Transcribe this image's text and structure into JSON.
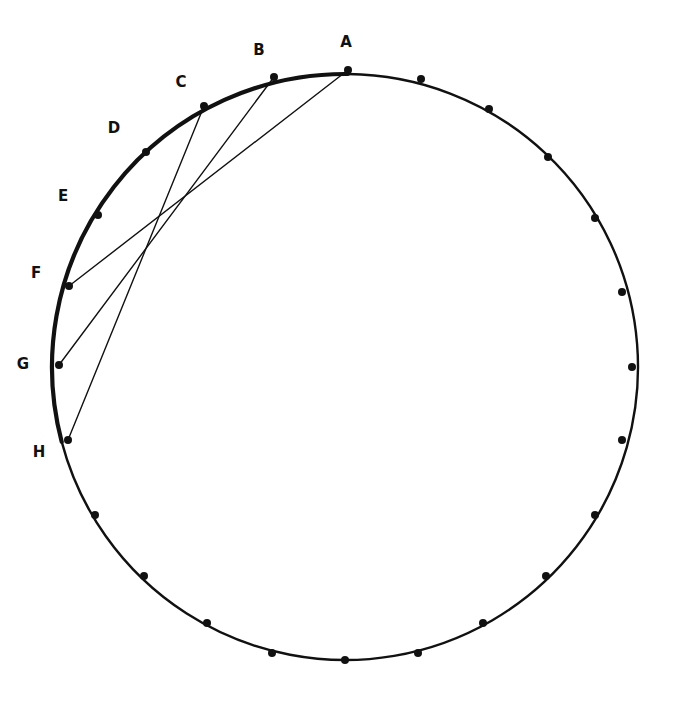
{
  "figure": {
    "kind": "geometry-diagram",
    "width": 679,
    "height": 709,
    "background_color": "#ffffff"
  },
  "chart_data": {
    "type": "scatter",
    "title": "",
    "subtitle": "",
    "xlabel": "",
    "ylabel": "",
    "grid": false,
    "legend": null,
    "xlim": [
      0,
      679
    ],
    "ylim": [
      709,
      0
    ],
    "circle": {
      "center_x": 345,
      "center_y": 367,
      "radius": 293,
      "stroke_color": "#111111",
      "stroke_width_top_left_arc": 4.2,
      "stroke_width_rest": 2.4,
      "fill": "none",
      "point_count": 24,
      "point_spacing_degrees": 15
    },
    "points": [
      {
        "id": "A",
        "label": "A",
        "x": 348,
        "y": 70,
        "label_x": 346,
        "label_y": 42,
        "labeled": true
      },
      {
        "id": "B",
        "label": "B",
        "x": 274,
        "y": 77,
        "label_x": 259,
        "label_y": 50,
        "labeled": true
      },
      {
        "id": "C",
        "label": "C",
        "x": 204,
        "y": 106,
        "label_x": 181,
        "label_y": 82,
        "labeled": true
      },
      {
        "id": "D",
        "label": "D",
        "x": 146,
        "y": 152,
        "label_x": 114,
        "label_y": 128,
        "labeled": true
      },
      {
        "id": "E",
        "label": "E",
        "x": 98,
        "y": 215,
        "label_x": 63,
        "label_y": 196,
        "labeled": true
      },
      {
        "id": "F",
        "label": "F",
        "x": 69,
        "y": 286,
        "label_x": 36,
        "label_y": 273,
        "labeled": true
      },
      {
        "id": "G",
        "label": "G",
        "x": 59,
        "y": 365,
        "label_x": 23,
        "label_y": 364,
        "labeled": true
      },
      {
        "id": "H",
        "label": "H",
        "x": 68,
        "y": 440,
        "label_x": 39,
        "label_y": 452,
        "labeled": true
      },
      {
        "id": "P09",
        "label": "",
        "x": 95,
        "y": 515,
        "labeled": false
      },
      {
        "id": "P10",
        "label": "",
        "x": 144,
        "y": 576,
        "labeled": false
      },
      {
        "id": "P11",
        "label": "",
        "x": 207,
        "y": 623,
        "labeled": false
      },
      {
        "id": "P12",
        "label": "",
        "x": 272,
        "y": 653,
        "labeled": false
      },
      {
        "id": "P13",
        "label": "",
        "x": 345,
        "y": 660,
        "labeled": false
      },
      {
        "id": "P14",
        "label": "",
        "x": 418,
        "y": 653,
        "labeled": false
      },
      {
        "id": "P15",
        "label": "",
        "x": 483,
        "y": 623,
        "labeled": false
      },
      {
        "id": "P16",
        "label": "",
        "x": 546,
        "y": 576,
        "labeled": false
      },
      {
        "id": "P17",
        "label": "",
        "x": 595,
        "y": 515,
        "labeled": false
      },
      {
        "id": "P18",
        "label": "",
        "x": 622,
        "y": 440,
        "labeled": false
      },
      {
        "id": "P19",
        "label": "",
        "x": 632,
        "y": 367,
        "labeled": false
      },
      {
        "id": "P20",
        "label": "",
        "x": 622,
        "y": 292,
        "labeled": false
      },
      {
        "id": "P21",
        "label": "",
        "x": 595,
        "y": 218,
        "labeled": false
      },
      {
        "id": "P22",
        "label": "",
        "x": 548,
        "y": 157,
        "labeled": false
      },
      {
        "id": "P23",
        "label": "",
        "x": 489,
        "y": 109,
        "labeled": false
      },
      {
        "id": "P24",
        "label": "",
        "x": 421,
        "y": 79,
        "labeled": false
      }
    ],
    "chords": [
      {
        "id": "chord-AF",
        "from": "A",
        "to": "F",
        "x1": 348,
        "y1": 70,
        "x2": 69,
        "y2": 286
      },
      {
        "id": "chord-BG",
        "from": "B",
        "to": "G",
        "x1": 274,
        "y1": 77,
        "x2": 59,
        "y2": 365
      },
      {
        "id": "chord-CH",
        "from": "C",
        "to": "H",
        "x1": 204,
        "y1": 106,
        "x2": 68,
        "y2": 440
      }
    ],
    "style": {
      "chord_color": "#111111",
      "chord_width": 1.4,
      "point_color": "#111111",
      "point_radius": 4.0,
      "label_color": "#111111",
      "label_font_size": 15,
      "label_font_weight": "bold"
    }
  }
}
